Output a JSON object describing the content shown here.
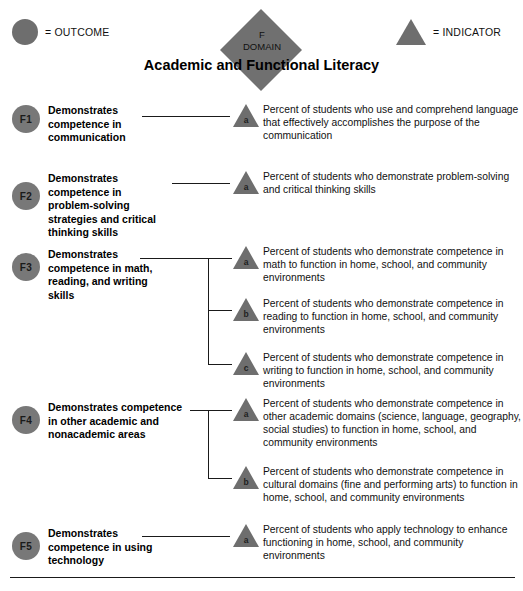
{
  "legend": {
    "outcome": {
      "icon": "circle-icon",
      "label": "= OUTCOME"
    },
    "indicator": {
      "icon": "triangle-icon",
      "label": "= INDICATOR"
    }
  },
  "domain": {
    "code": "F",
    "kind": "DOMAIN",
    "title": "Academic and Functional Literacy"
  },
  "rows": [
    {
      "code": "F1",
      "outcome": "Demonstrates competence in communication",
      "indicators": [
        {
          "letter": "a",
          "text": "Percent of students who use and comprehend language that effectively accomplishes the purpose of the communication"
        }
      ]
    },
    {
      "code": "F2",
      "outcome": "Demonstrates competence in problem-solving strategies and critical thinking skills",
      "indicators": [
        {
          "letter": "a",
          "text": "Percent of students who demonstrate problem-solving and critical thinking skills"
        }
      ]
    },
    {
      "code": "F3",
      "outcome": "Demonstrates competence in math, reading, and writing skills",
      "indicators": [
        {
          "letter": "a",
          "text": "Percent of students who demonstrate competence in math to function in home, school, and community environments"
        },
        {
          "letter": "b",
          "text": "Percent of students who demonstrate competence in reading to function in home, school, and community environments"
        },
        {
          "letter": "c",
          "text": "Percent of students who demonstrate competence in writing to function in home, school, and community environments"
        }
      ]
    },
    {
      "code": "F4",
      "outcome": "Demonstrates competence in other academic and nonacademic areas",
      "indicators": [
        {
          "letter": "a",
          "text": "Percent of students who demonstrate competence in other academic domains (science, language, geography, social studies) to function in home, school, and community environments"
        },
        {
          "letter": "b",
          "text": "Percent of students who demonstrate competence in cultural domains (fine and performing arts) to function in home, school, and community environments"
        }
      ]
    },
    {
      "code": "F5",
      "outcome": "Demonstrates competence in using technology",
      "indicators": [
        {
          "letter": "a",
          "text": "Percent of students who apply technology to enhance functioning in home, school, and community environments"
        }
      ]
    }
  ],
  "colors": {
    "shape_fill": "#6e6e6e",
    "line": "#1a1a1a",
    "text": "#111111"
  }
}
